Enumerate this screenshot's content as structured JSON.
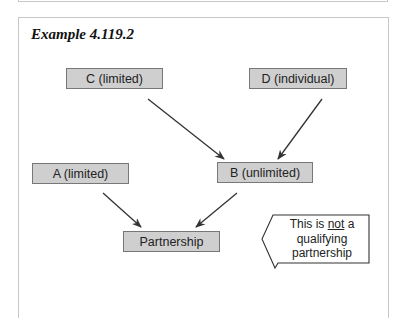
{
  "title": "Example 4.119.2",
  "nodes": {
    "c": "C (limited)",
    "d": "D (individual)",
    "a": "A (limited)",
    "b": "B (unlimited)",
    "p": "Partnership"
  },
  "callout": {
    "line1_pre": "This is ",
    "line1_emph": "not",
    "line1_post": " a",
    "line2": "qualifying",
    "line3": "partnership"
  },
  "edges": [
    {
      "from": "C (limited)",
      "to": "B (unlimited)"
    },
    {
      "from": "D (individual)",
      "to": "B (unlimited)"
    },
    {
      "from": "A (limited)",
      "to": "Partnership"
    },
    {
      "from": "B (unlimited)",
      "to": "Partnership"
    }
  ],
  "colors": {
    "node_fill": "#cfcfcf",
    "node_border": "#777777",
    "arrow": "#333333"
  }
}
